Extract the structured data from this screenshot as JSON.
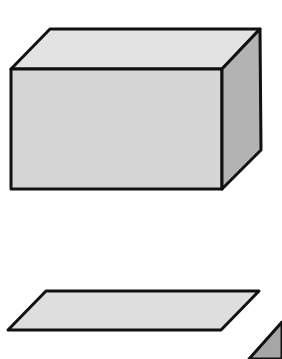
{
  "diagram": {
    "type": "geometric-shapes",
    "background": "#ffffff",
    "stroke_color": "#111111",
    "stroke_width": 3,
    "shapes": [
      {
        "name": "rectangular-prism",
        "faces": {
          "top": {
            "points": "50,29 260,29 222,69 11,69",
            "fill": "#e3e3e3"
          },
          "front": {
            "points": "11,69 222,69 222,189 11,189",
            "fill": "#d6d6d6"
          },
          "side": {
            "points": "222,69 260,29 261,150 222,189",
            "fill": "#b3b3b3"
          }
        }
      },
      {
        "name": "parallelogram",
        "points": "46,291 259,291 221,330 8,330",
        "fill": "#dedede"
      },
      {
        "name": "partial-shape-cropped",
        "points": "282,322 282,359 249,359",
        "fill": "#a6a6a6"
      }
    ]
  }
}
